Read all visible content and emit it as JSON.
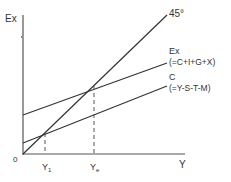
{
  "diagram": {
    "y_axis_label": "Ex",
    "x_axis_label": "Y",
    "origin_label": "0",
    "line_45_label": "45°",
    "ex_label": "Ex",
    "ex_formula": "(=C+I+G+X)",
    "c_label": "C",
    "c_formula": "(=Y-S-T-M)",
    "y1_label": "Y",
    "y1_sub": "1",
    "ye_label": "Y",
    "ye_sub": "e",
    "line_color": "#333333"
  }
}
